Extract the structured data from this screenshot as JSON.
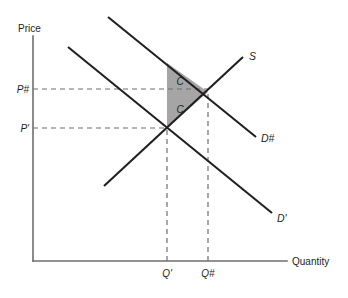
{
  "figure": {
    "type": "supply-demand-diagram",
    "title": "",
    "background_color": "#ffffff",
    "axes": {
      "y_label": "Price",
      "x_label": "Quantity",
      "axis_color": "#6d6e71",
      "origin": {
        "x": 33,
        "y": 261
      },
      "y_axis_top": {
        "x": 33,
        "y": 36
      },
      "x_axis_right": {
        "x": 287,
        "y": 261
      }
    },
    "price_ticks": [
      {
        "id": "p-new",
        "label": "P#",
        "y": 89,
        "guide_from_x": 33,
        "guide_to_x": 208
      },
      {
        "id": "p-old",
        "label": "P'",
        "y": 128,
        "guide_from_x": 33,
        "guide_to_x": 167
      }
    ],
    "quantity_ticks": [
      {
        "id": "q-old",
        "label": "Q'",
        "x": 167,
        "guide_from_y": 261,
        "guide_to_y": 128
      },
      {
        "id": "q-new",
        "label": "Q#",
        "x": 208,
        "guide_from_y": 261,
        "guide_to_y": 92
      }
    ],
    "curves": [
      {
        "id": "supply",
        "label": "S",
        "kind": "supply",
        "slope": "upward",
        "from": {
          "x": 104,
          "y": 186
        },
        "to": {
          "x": 243,
          "y": 57
        },
        "label_pos": {
          "x": 249,
          "y": 56
        }
      },
      {
        "id": "demand-old",
        "label": "D'",
        "kind": "demand",
        "slope": "downward",
        "from": {
          "x": 68,
          "y": 47
        },
        "to": {
          "x": 272,
          "y": 213
        },
        "label_pos": {
          "x": 277,
          "y": 219
        }
      },
      {
        "id": "demand-new",
        "label": "D#",
        "kind": "demand-shifted",
        "slope": "downward",
        "from": {
          "x": 108,
          "y": 17
        },
        "to": {
          "x": 256,
          "y": 137
        },
        "label_pos": {
          "x": 261,
          "y": 139
        }
      }
    ],
    "equilibria": [
      {
        "id": "old-equilibrium",
        "price_label": "P'",
        "quantity_label": "Q'",
        "x": 167,
        "y": 128
      },
      {
        "id": "new-equilibrium",
        "price_label": "P#",
        "quantity_label": "Q#",
        "x": 208,
        "y": 92
      }
    ],
    "shaded_region": {
      "id": "surplus-triangle",
      "fill_color": "#9d9d9d",
      "polygon": "167,63 208,92 167,128",
      "labels": [
        {
          "text": "C",
          "x": 180,
          "y": 85
        },
        {
          "text": "C",
          "x": 180,
          "y": 113
        }
      ]
    }
  }
}
